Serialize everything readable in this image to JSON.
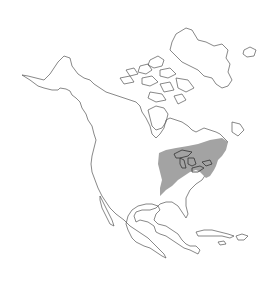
{
  "map": {
    "region": "North America",
    "background_color": "#ffffff",
    "outline_color": "#555555",
    "range_fill_color": "#a3a3a3",
    "highlighted_area": "Eastern United States and southeastern Canada (Great Lakes region)",
    "labels": []
  }
}
